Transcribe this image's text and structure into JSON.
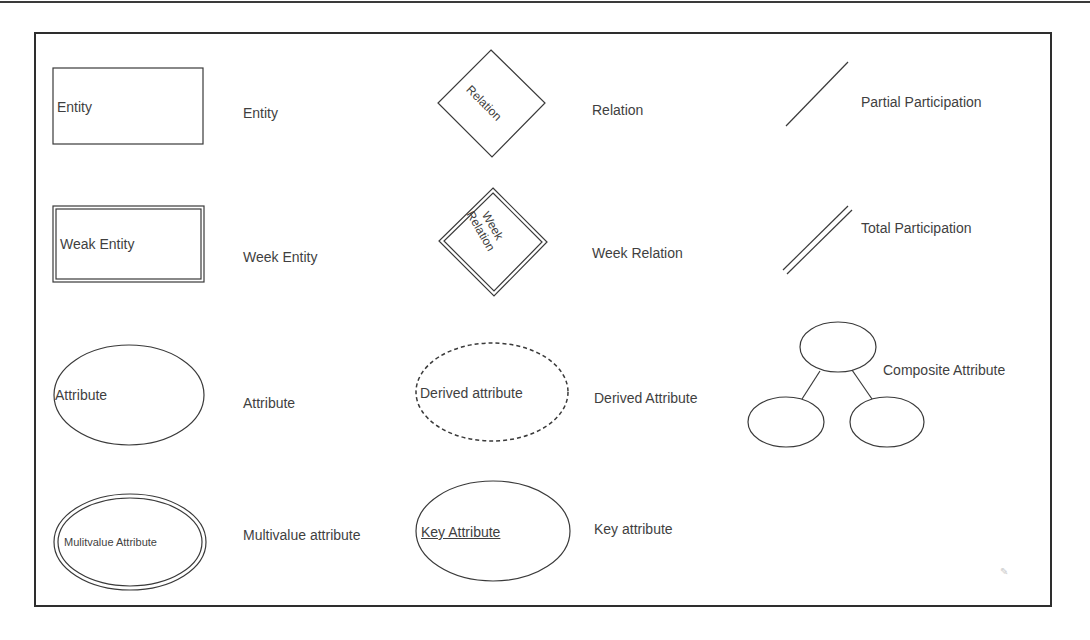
{
  "legend": {
    "entity": {
      "shape_text": "Entity",
      "label": "Entity"
    },
    "relation": {
      "shape_text": "Relation",
      "label": "Relation"
    },
    "partial_participation": {
      "label": "Partial Participation"
    },
    "weak_entity": {
      "shape_text": "Weak Entity",
      "label": "Week Entity"
    },
    "weak_relation": {
      "shape_text_line1": "Week",
      "shape_text_line2": "Relation",
      "label": "Week Relation"
    },
    "total_participation": {
      "label": "Total Participation"
    },
    "attribute": {
      "shape_text": "Attribute",
      "label": "Attribute"
    },
    "derived_attribute": {
      "shape_text": "Derived attribute",
      "label": "Derived Attribute"
    },
    "composite_attribute": {
      "label": "Composite Attribute"
    },
    "multivalue_attribute": {
      "shape_text": "Mulitvalue Attribute",
      "label": "Multivalue attribute"
    },
    "key_attribute": {
      "shape_text": "Key Attribute",
      "label": "Key attribute"
    }
  },
  "colors": {
    "stroke": "#3a3a3a",
    "background": "#ffffff"
  }
}
